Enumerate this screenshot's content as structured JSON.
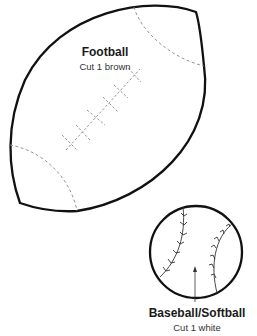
{
  "football": {
    "title": "Football",
    "instruction": "Cut 1 brown"
  },
  "baseball": {
    "title": "Baseball/Softball",
    "instruction": "Cut 1 white"
  },
  "colors": {
    "outline": "#111111",
    "dashed": "#888888"
  }
}
